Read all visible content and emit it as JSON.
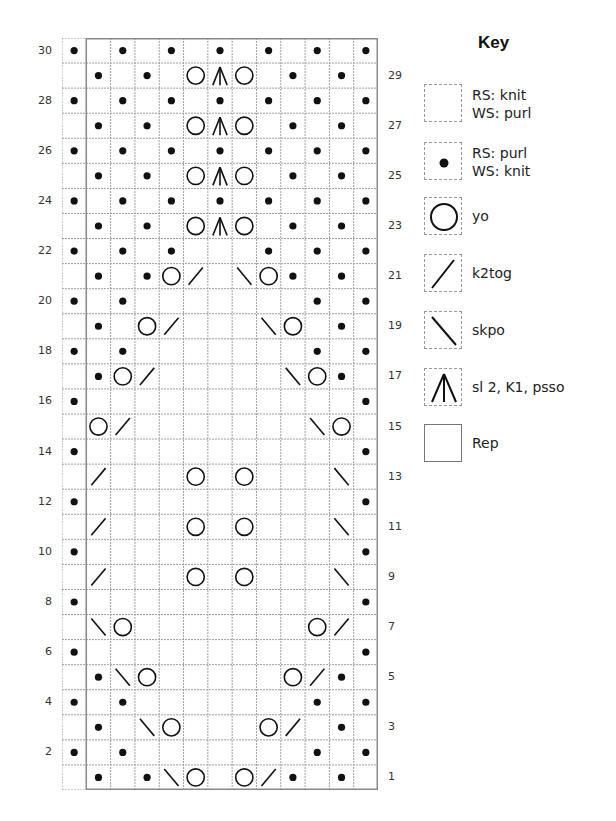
{
  "chart": {
    "columns": 13,
    "rows": 30,
    "repeat": {
      "start_col": 2,
      "end_col": 13,
      "label": "Rep"
    },
    "row_numbers_left": [
      "30",
      "28",
      "26",
      "24",
      "22",
      "20",
      "18",
      "16",
      "14",
      "12",
      "10",
      "8",
      "6",
      "4",
      "2"
    ],
    "row_numbers_right": [
      "29",
      "27",
      "25",
      "23",
      "21",
      "19",
      "17",
      "15",
      "13",
      "11",
      "9",
      "7",
      "5",
      "3",
      "1"
    ],
    "rows_data": {
      "30": {
        "dot": [
          1,
          3,
          5,
          7,
          9,
          11,
          13
        ]
      },
      "29": {
        "dot": [
          2,
          4,
          10,
          12
        ],
        "yo": [
          6,
          8
        ],
        "s2k1psso": [
          7
        ]
      },
      "28": {
        "dot": [
          1,
          3,
          5,
          7,
          9,
          11,
          13
        ]
      },
      "27": {
        "dot": [
          2,
          4,
          10,
          12
        ],
        "yo": [
          6,
          8
        ],
        "s2k1psso": [
          7
        ]
      },
      "26": {
        "dot": [
          1,
          3,
          5,
          7,
          9,
          11,
          13
        ]
      },
      "25": {
        "dot": [
          2,
          4,
          10,
          12
        ],
        "yo": [
          6,
          8
        ],
        "s2k1psso": [
          7
        ]
      },
      "24": {
        "dot": [
          1,
          3,
          5,
          7,
          9,
          11,
          13
        ]
      },
      "23": {
        "dot": [
          2,
          4,
          10,
          12
        ],
        "yo": [
          6,
          8
        ],
        "s2k1psso": [
          7
        ]
      },
      "22": {
        "dot": [
          1,
          3,
          5,
          9,
          11,
          13
        ]
      },
      "21": {
        "dot": [
          2,
          4,
          10,
          12
        ],
        "yo": [
          5,
          9
        ],
        "k2tog": [
          6
        ],
        "skpo": [
          8
        ]
      },
      "20": {
        "dot": [
          1,
          3,
          11,
          13
        ]
      },
      "19": {
        "dot": [
          2,
          12
        ],
        "yo": [
          4,
          10
        ],
        "k2tog": [
          5
        ],
        "skpo": [
          9
        ]
      },
      "18": {
        "dot": [
          1,
          3,
          11,
          13
        ]
      },
      "17": {
        "dot": [
          2,
          12
        ],
        "yo": [
          3,
          11
        ],
        "k2tog": [
          4
        ],
        "skpo": [
          10
        ]
      },
      "16": {
        "dot": [
          1,
          13
        ]
      },
      "15": {
        "yo": [
          2,
          12
        ],
        "k2tog": [
          3
        ],
        "skpo": [
          11
        ]
      },
      "14": {
        "dot": [
          1,
          13
        ]
      },
      "13": {
        "k2tog": [
          2
        ],
        "yo": [
          6,
          8
        ],
        "skpo": [
          12
        ]
      },
      "12": {
        "dot": [
          1,
          13
        ]
      },
      "11": {
        "k2tog": [
          2
        ],
        "yo": [
          6,
          8
        ],
        "skpo": [
          12
        ]
      },
      "10": {
        "dot": [
          1,
          13
        ]
      },
      "9": {
        "k2tog": [
          2
        ],
        "yo": [
          6,
          8
        ],
        "skpo": [
          12
        ]
      },
      "8": {
        "dot": [
          1,
          13
        ]
      },
      "7": {
        "skpo": [
          2
        ],
        "yo": [
          3,
          11
        ],
        "k2tog": [
          12
        ]
      },
      "6": {
        "dot": [
          1,
          13
        ]
      },
      "5": {
        "dot": [
          2,
          12
        ],
        "skpo": [
          3
        ],
        "yo": [
          4,
          10
        ],
        "k2tog": [
          11
        ]
      },
      "4": {
        "dot": [
          1,
          3,
          11,
          13
        ]
      },
      "3": {
        "dot": [
          2,
          12
        ],
        "skpo": [
          4
        ],
        "yo": [
          5,
          9
        ],
        "k2tog": [
          10
        ]
      },
      "2": {
        "dot": [
          1,
          3,
          11,
          13
        ]
      },
      "1": {
        "dot": [
          2,
          4,
          10,
          12
        ],
        "skpo": [
          5
        ],
        "yo": [
          6,
          8
        ],
        "k2tog": [
          9
        ]
      }
    }
  },
  "key": {
    "title": "Key",
    "items": [
      {
        "symbol": "knit",
        "line1": "RS: knit",
        "line2": "WS: purl"
      },
      {
        "symbol": "dot",
        "line1": "RS: purl",
        "line2": "WS: knit"
      },
      {
        "symbol": "yo",
        "line1": "yo"
      },
      {
        "symbol": "k2tog",
        "line1": "k2tog"
      },
      {
        "symbol": "skpo",
        "line1": "skpo"
      },
      {
        "symbol": "s2k1psso",
        "line1": "sl 2, K1, psso"
      },
      {
        "symbol": "rep",
        "line1": "Rep"
      }
    ]
  },
  "colors": {
    "grid": "#a0a0a0",
    "rep_border": "#8a8a8a",
    "ink": "#111111"
  }
}
